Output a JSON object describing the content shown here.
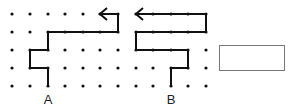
{
  "grid": {
    "columns_x": [
      12,
      30,
      48,
      65,
      83,
      100,
      118,
      136,
      153,
      171,
      188,
      206
    ],
    "rows_y": [
      14,
      32,
      50,
      68,
      86
    ],
    "dot_color": "#111111"
  },
  "paths": [
    {
      "name": "path-a",
      "start_label": "A",
      "points": [
        [
          48,
          86
        ],
        [
          48,
          68
        ],
        [
          30,
          68
        ],
        [
          30,
          50
        ],
        [
          48,
          50
        ],
        [
          48,
          32
        ],
        [
          118,
          32
        ],
        [
          118,
          14
        ],
        [
          100,
          14
        ]
      ],
      "arrow_end": true
    },
    {
      "name": "path-b",
      "start_label": "B",
      "points": [
        [
          171,
          86
        ],
        [
          171,
          68
        ],
        [
          188,
          68
        ],
        [
          188,
          50
        ],
        [
          136,
          50
        ],
        [
          136,
          32
        ],
        [
          206,
          32
        ],
        [
          206,
          14
        ],
        [
          136,
          14
        ]
      ],
      "arrow_end": true
    }
  ],
  "labels": {
    "a": "A",
    "b": "B"
  },
  "answer_box": {
    "value": ""
  }
}
